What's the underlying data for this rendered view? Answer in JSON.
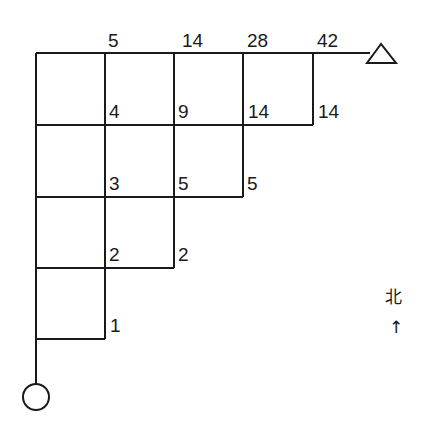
{
  "diagram": {
    "type": "grid-path-counting",
    "start_marker": "circle",
    "end_marker": "triangle",
    "top_labels": [
      "5",
      "14",
      "28",
      "42"
    ],
    "row1_labels": [
      "4",
      "9",
      "14",
      "14"
    ],
    "row2_labels": [
      "3",
      "5",
      "5"
    ],
    "row3_labels": [
      "2",
      "2"
    ],
    "row4_labels": [
      "1"
    ],
    "compass": {
      "label": "北",
      "arrow": "↑"
    }
  },
  "colors": {
    "line": "#1a1a1a",
    "background": "#ffffff"
  }
}
